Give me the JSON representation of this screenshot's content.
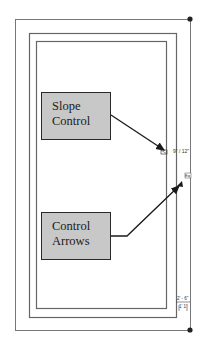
{
  "diagram": {
    "callouts": [
      {
        "id": "slope-control",
        "lines": [
          "Slope",
          "Control"
        ]
      },
      {
        "id": "control-arrows",
        "lines": [
          "Control",
          "Arrows"
        ]
      }
    ],
    "annotations": {
      "slope_value": "9\" / 12\"",
      "side_tag": "Eq",
      "dimension_top": "2' - 6\"",
      "dimension_bottom": "1' 1\""
    },
    "colors": {
      "callout_fill": "#c8c8c8",
      "line": "#555555",
      "arrow": "#1a1a1a"
    }
  }
}
